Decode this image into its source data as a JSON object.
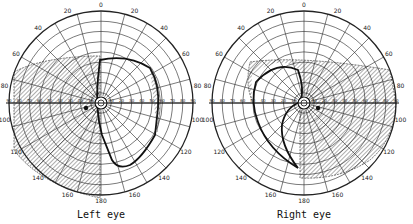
{
  "figure": {
    "type": "visual field perimetry charts",
    "charts": [
      {
        "id": "left",
        "caption": "Left eye",
        "center": [
          101,
          103
        ],
        "radius": 92,
        "angle_labels": [
          "0",
          "20",
          "40",
          "60",
          "80",
          "100",
          "120",
          "140",
          "160",
          "180",
          "160",
          "140",
          "120",
          "100",
          "80",
          "60",
          "40",
          "20"
        ],
        "scale_labels_left": [
          "90",
          "80",
          "70",
          "60",
          "50",
          "40",
          "30",
          "20",
          "10"
        ],
        "scale_labels_right": [
          "10",
          "20",
          "30",
          "40",
          "50",
          "60",
          "70",
          "80",
          "90"
        ]
      },
      {
        "id": "right",
        "caption": "Right eye",
        "center": [
          304,
          103
        ],
        "radius": 92,
        "angle_labels": [
          "0",
          "20",
          "40",
          "60",
          "80",
          "100",
          "120",
          "140",
          "160",
          "180",
          "160",
          "140",
          "120",
          "100",
          "80",
          "60",
          "40",
          "20"
        ],
        "scale_labels_left": [
          "90",
          "80",
          "70",
          "60",
          "50",
          "40",
          "30",
          "20",
          "10"
        ],
        "scale_labels_right": [
          "10",
          "20",
          "30",
          "40",
          "50",
          "60",
          "70",
          "80",
          "90"
        ]
      }
    ],
    "colors": {
      "ink": "#1a1a1a",
      "background": "#ffffff",
      "hatch": "#333333"
    }
  }
}
